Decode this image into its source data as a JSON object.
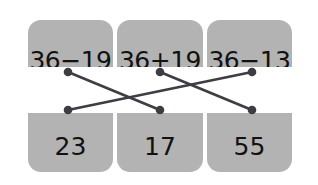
{
  "background_color": "#ffffff",
  "card_color": "#b3b3b3",
  "band_color": "#ffffff",
  "ink_color": "#111111",
  "line_color": "#3d3d44",
  "cards": [
    {
      "id": "card-left",
      "expression": "36−19",
      "answer": "23"
    },
    {
      "id": "card-middle",
      "expression": "36+19",
      "answer": "17"
    },
    {
      "id": "card-right",
      "expression": "36−13",
      "answer": "55"
    }
  ],
  "connector_dots": {
    "top": [
      {
        "x": 68,
        "y": 72
      },
      {
        "x": 160,
        "y": 72
      },
      {
        "x": 252,
        "y": 72
      }
    ],
    "bottom": [
      {
        "x": 68,
        "y": 110
      },
      {
        "x": 160,
        "y": 110
      },
      {
        "x": 252,
        "y": 110
      }
    ]
  },
  "connections": [
    {
      "from_top": 0,
      "to_bottom": 1,
      "label": "36−19 matches 17"
    },
    {
      "from_top": 1,
      "to_bottom": 2,
      "label": "36+19 matches 55"
    },
    {
      "from_top": 2,
      "to_bottom": 0,
      "label": "36−13 matches 23"
    }
  ]
}
